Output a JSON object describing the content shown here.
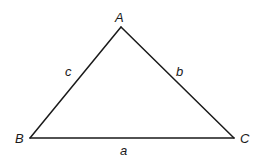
{
  "diagram": {
    "type": "triangle",
    "vertices": {
      "A": {
        "label": "A",
        "x": 121,
        "y": 27
      },
      "B": {
        "label": "B",
        "x": 30,
        "y": 138
      },
      "C": {
        "label": "C",
        "x": 234,
        "y": 138
      }
    },
    "sides": {
      "a": {
        "label": "a",
        "from": "B",
        "to": "C"
      },
      "b": {
        "label": "b",
        "from": "A",
        "to": "C"
      },
      "c": {
        "label": "c",
        "from": "A",
        "to": "B"
      }
    },
    "colors": {
      "stroke": "#1a1a1a",
      "background": "#ffffff"
    }
  }
}
